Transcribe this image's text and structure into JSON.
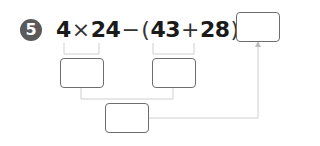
{
  "problem": {
    "number": "5",
    "expression": {
      "a": "4",
      "times": "×",
      "b": "24",
      "minus": "−",
      "lparen": "(",
      "c": "43",
      "plus": "+",
      "d": "28",
      "rparen": ")",
      "equals": "="
    },
    "answer_box": {
      "value": ""
    },
    "step_boxes": [
      {
        "label": "4×24 result",
        "value": ""
      },
      {
        "label": "43+28 result",
        "value": ""
      },
      {
        "label": "difference result",
        "value": ""
      }
    ]
  },
  "colors": {
    "badge": "#5a5a5a",
    "text": "#1a1a1a",
    "box_border": "#6d6d6d",
    "connector": "#cfcfcf"
  }
}
